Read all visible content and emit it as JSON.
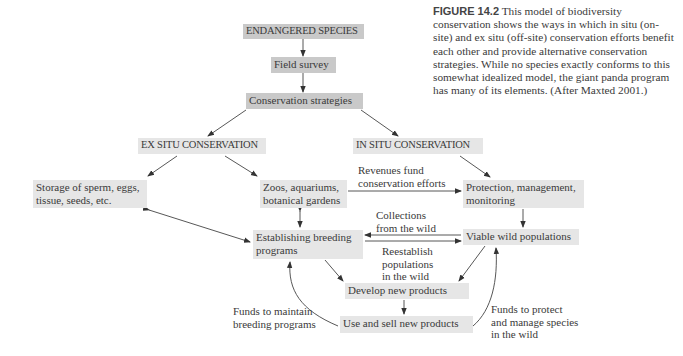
{
  "caption": {
    "figure_label": "FIGURE 14.2",
    "text": "This model of biodiversity conservation shows the ways in which in situ (on-site) and ex situ (off-site) conservation efforts benefit each other and provide alternative conservation strategies. While no species exactly conforms to this somewhat idealized model, the giant panda program has many of its elements. (After Maxted 2001.)"
  },
  "nodes": {
    "endangered": "ENDANGERED SPECIES",
    "field_survey": "Field survey",
    "strategies": "Conservation strategies",
    "ex_situ": "EX SITU CONSERVATION",
    "in_situ": "IN SITU CONSERVATION",
    "storage_l1": "Storage of sperm, eggs,",
    "storage_l2": "tissue, seeds, etc.",
    "zoos_l1": "Zoos, aquariums,",
    "zoos_l2": "botanical gardens",
    "protection_l1": "Protection, management,",
    "protection_l2": "monitoring",
    "breeding_l1": "Establishing breeding",
    "breeding_l2": "programs",
    "viable": "Viable wild populations",
    "develop": "Develop new products",
    "use_sell": "Use and sell new products"
  },
  "edge_labels": {
    "revenues_l1": "Revenues fund",
    "revenues_l2": "conservation efforts",
    "collections_l1": "Collections",
    "collections_l2": "from the wild",
    "reestablish_l1": "Reestablish",
    "reestablish_l2": "populations",
    "reestablish_l3": "in the wild",
    "funds_breeding_l1": "Funds to maintain",
    "funds_breeding_l2": "breeding programs",
    "funds_protect_l1": "Funds to protect",
    "funds_protect_l2": "and manage species",
    "funds_protect_l3": "in the wild"
  },
  "colors": {
    "box_fill": "#e6e6e6",
    "box_fill_dark": "#c9c9c9",
    "arrow": "#333333"
  }
}
